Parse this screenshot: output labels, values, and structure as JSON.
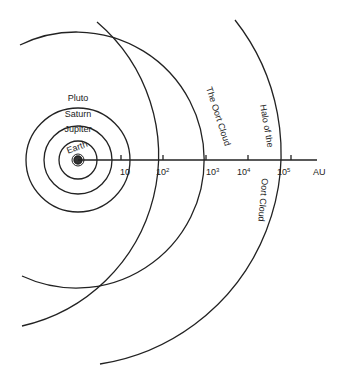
{
  "diagram": {
    "orbits": [
      {
        "label": "Earth"
      },
      {
        "label": "Jupiter"
      },
      {
        "label": "Saturn"
      },
      {
        "label": "Pluto"
      }
    ],
    "regions": [
      {
        "label": "The Oort Cloud"
      },
      {
        "label": "Halo of the"
      },
      {
        "label": "Oort Cloud"
      }
    ],
    "axis": {
      "unit": "AU",
      "ticks": [
        {
          "base": "10",
          "exp": ""
        },
        {
          "base": "10",
          "exp": "2"
        },
        {
          "base": "10",
          "exp": "3"
        },
        {
          "base": "10",
          "exp": "4"
        },
        {
          "base": "10",
          "exp": "5"
        }
      ]
    }
  }
}
